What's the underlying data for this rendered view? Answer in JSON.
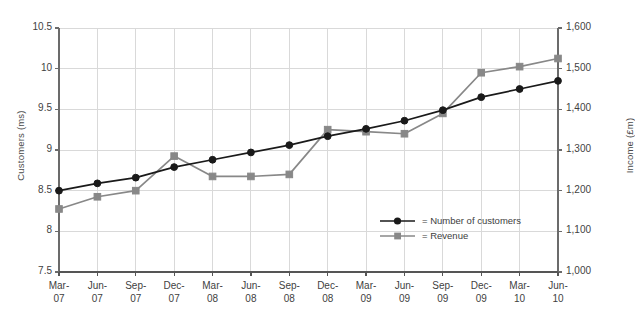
{
  "chart_data": {
    "type": "line",
    "title": "",
    "xlabel": "",
    "categories": [
      "Mar-07",
      "Jun-07",
      "Sep-07",
      "Dec-07",
      "Mar-08",
      "Jun-08",
      "Sep-08",
      "Dec-08",
      "Mar-09",
      "Jun-09",
      "Sep-09",
      "Dec-09",
      "Mar-10",
      "Jun-10"
    ],
    "grid": true,
    "legend_position": "inside-bottom-right",
    "axes": {
      "left": {
        "label": "Customers (ms)",
        "ticks": [
          "7.5",
          "8",
          "8.5",
          "9",
          "9.5",
          "10",
          "10.5"
        ],
        "tick_values": [
          7.5,
          8,
          8.5,
          9,
          9.5,
          10,
          10.5
        ],
        "ylim": [
          7.5,
          10.5
        ]
      },
      "right": {
        "label": "Income (£m)",
        "ticks": [
          "1,000",
          "1,100",
          "1,200",
          "1,300",
          "1,400",
          "1,500",
          "1,600"
        ],
        "tick_values": [
          1000,
          1100,
          1200,
          1300,
          1400,
          1500,
          1600
        ],
        "ylim": [
          1000,
          1600
        ]
      }
    },
    "series": [
      {
        "name": "Number of customers",
        "legend_label": "= Number of customers",
        "axis": "left",
        "color": "#1a1a1a",
        "marker": "circle",
        "values": [
          8.5,
          8.59,
          8.66,
          8.79,
          8.88,
          8.97,
          9.06,
          9.17,
          9.26,
          9.36,
          9.49,
          9.65,
          9.75,
          9.85
        ]
      },
      {
        "name": "Revenue",
        "legend_label": "= Revenue",
        "axis": "right",
        "color": "#888888",
        "marker": "square",
        "values": [
          1155,
          1185,
          1200,
          1285,
          1235,
          1235,
          1240,
          1350,
          1345,
          1340,
          1390,
          1490,
          1505,
          1525
        ]
      }
    ]
  },
  "colors": {
    "customers": "#1a1a1a",
    "revenue": "#888888",
    "grid": "#d9d9d9",
    "axis": "#6b6b6b",
    "text": "#3f3f3f",
    "background": "#ffffff"
  }
}
